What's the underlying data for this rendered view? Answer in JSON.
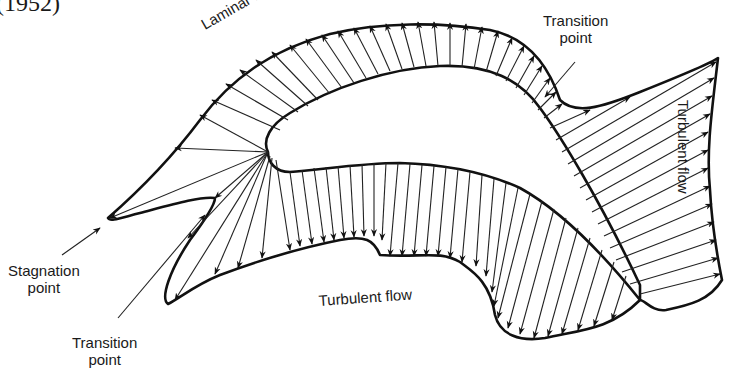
{
  "caption_fragment": "(1952)",
  "labels": {
    "laminar_flow": "Laminar flow",
    "transition_point_top": [
      "Transition",
      "point"
    ],
    "turbulent_flow_right": "Turbulent flow",
    "stagnation_point": [
      "Stagnation",
      "point"
    ],
    "transition_point_bottom": [
      "Transition",
      "point"
    ],
    "turbulent_flow_bottom": "Turbulent flow"
  },
  "diagram": {
    "regions": [
      {
        "name": "suction-side",
        "flow": "Laminar flow",
        "then": "Turbulent flow"
      },
      {
        "name": "pressure-side",
        "flow": "Turbulent flow"
      }
    ],
    "annotated_points": [
      "Stagnation point",
      "Transition point (suction side)",
      "Transition point (pressure side)"
    ],
    "colors": {
      "stroke": "#111111",
      "background": "#ffffff"
    }
  }
}
